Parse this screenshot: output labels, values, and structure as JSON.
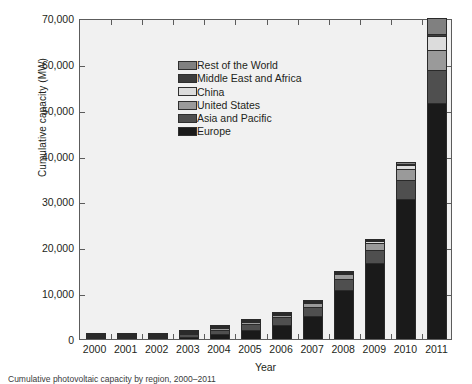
{
  "chart_data": {
    "type": "bar",
    "subtype": "stacked",
    "title": "",
    "xlabel": "Year",
    "ylabel": "Cumulative capacity (MW)",
    "categories": [
      "2000",
      "2001",
      "2002",
      "2003",
      "2004",
      "2005",
      "2006",
      "2007",
      "2008",
      "2009",
      "2010",
      "2011"
    ],
    "ylim": [
      0,
      70000
    ],
    "yticks": [
      0,
      10000,
      20000,
      30000,
      40000,
      50000,
      60000,
      70000
    ],
    "ytick_labels": [
      "0",
      "10,000",
      "20,000",
      "30,000",
      "40,000",
      "50,000",
      "60,000",
      "70,000"
    ],
    "grid": false,
    "legend_position": "upper-left-inside",
    "plot_background": "#f1f1f1",
    "series": [
      {
        "name": "Europe",
        "color": "#1a1a1a",
        "values": [
          150,
          260,
          390,
          600,
          1300,
          2250,
          3250,
          5200,
          10900,
          16600,
          30500,
          51500
        ]
      },
      {
        "name": "Asia and Pacific",
        "color": "#4f4f4f",
        "values": [
          330,
          480,
          680,
          920,
          1180,
          1470,
          1830,
          2100,
          2400,
          2900,
          4100,
          7200
        ]
      },
      {
        "name": "United States",
        "color": "#9a9a9a",
        "values": [
          140,
          170,
          215,
          280,
          375,
          480,
          620,
          840,
          1170,
          1620,
          2530,
          4380
        ]
      },
      {
        "name": "China",
        "color": "#dcdcdc",
        "values": [
          20,
          30,
          45,
          55,
          65,
          70,
          80,
          100,
          140,
          300,
          800,
          3100
        ]
      },
      {
        "name": "Middle East and Africa",
        "color": "#3c3c3c",
        "values": [
          25,
          30,
          35,
          45,
          55,
          65,
          75,
          90,
          110,
          140,
          200,
          430
        ]
      },
      {
        "name": "Rest of the World",
        "color": "#808080",
        "values": [
          35,
          40,
          45,
          50,
          60,
          70,
          85,
          100,
          140,
          200,
          370,
          3390
        ]
      }
    ],
    "stack_order_bottom_to_top": [
      "Europe",
      "Asia and Pacific",
      "United States",
      "China",
      "Middle East and Africa",
      "Rest of the World"
    ],
    "totals": [
      700,
      1010,
      1410,
      1950,
      3035,
      4405,
      5940,
      8430,
      14860,
      21760,
      38500,
      70000
    ],
    "annotations": []
  },
  "legend": {
    "entries": [
      {
        "label": "Rest of the World",
        "color": "#808080"
      },
      {
        "label": "Middle East and Africa",
        "color": "#3c3c3c"
      },
      {
        "label": "China",
        "color": "#dcdcdc"
      },
      {
        "label": "United States",
        "color": "#9a9a9a"
      },
      {
        "label": "Asia and Pacific",
        "color": "#4f4f4f"
      },
      {
        "label": "Europe",
        "color": "#1a1a1a"
      }
    ]
  },
  "caption": {
    "text": "Cumulative photovoltaic capacity by region, 2000–2011"
  }
}
